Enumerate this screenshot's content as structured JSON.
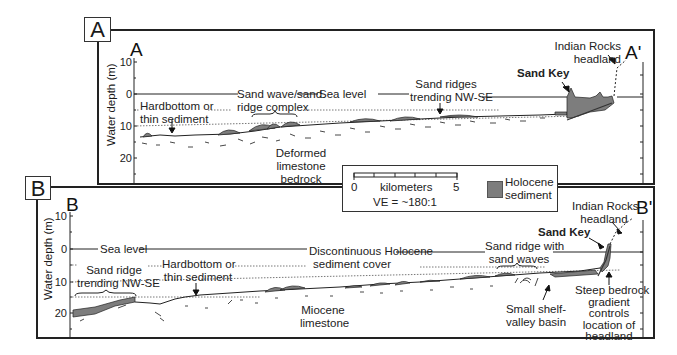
{
  "figure": {
    "panel_a": {
      "tag": "A",
      "start_label": "A",
      "end_label": "A'",
      "y_axis_label": "Water depth (m)",
      "y_ticks": [
        "10",
        "0",
        "10",
        "20"
      ],
      "annotations": {
        "hardbottom": [
          "Hardbottom or",
          "thin sediment"
        ],
        "sand_wave": [
          "Sand wave/sand",
          "ridge complex"
        ],
        "sea_level": "Sea level",
        "sand_ridges": [
          "Sand ridges",
          "trending NW-SE"
        ],
        "sand_key": "Sand Key",
        "indian_rocks": [
          "Indian Rocks",
          "headland"
        ],
        "deformed": [
          "Deformed",
          "limestone",
          "bedrock"
        ]
      }
    },
    "panel_b": {
      "tag": "B",
      "start_label": "B",
      "end_label": "B'",
      "y_axis_label": "Water depth (m)",
      "y_ticks": [
        "10",
        "0",
        "10",
        "20"
      ],
      "annotations": {
        "sea_level": "Sea level",
        "sand_ridge": [
          "Sand ridge",
          "trending NW-SE"
        ],
        "hardbottom": [
          "Hardbottom or",
          "thin sediment"
        ],
        "discontinuous": [
          "Discontinuous Holocene",
          "sediment cover"
        ],
        "sand_ridge_waves": [
          "Sand ridge with",
          "sand waves"
        ],
        "sand_key": "Sand Key",
        "indian_rocks": [
          "Indian Rocks",
          "headland"
        ],
        "miocene": [
          "Miocene",
          "limestone"
        ],
        "shelf_valley": [
          "Small shelf-",
          "valley basin"
        ],
        "steep_bedrock": [
          "Steep bedrock",
          "gradient",
          "controls",
          "location of",
          "headland"
        ]
      }
    },
    "legend": {
      "scale_start": "0",
      "scale_end": "5",
      "scale_unit": "kilometers",
      "vertical_exaggeration": "VE = ~180:1",
      "swatch_label": [
        "Holocene",
        "sediment"
      ],
      "swatch_color": "#7d7d7d"
    }
  }
}
